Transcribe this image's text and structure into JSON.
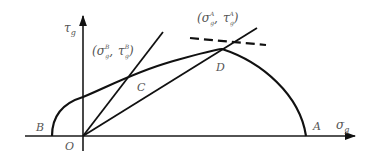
{
  "diagram": {
    "axes": {
      "x_label": "σ",
      "x_label_sub": "g",
      "y_label": "τ",
      "y_label_sub": "g",
      "origin_label": "O"
    },
    "points": {
      "A": "A",
      "B": "B",
      "C": "C",
      "D": "D"
    },
    "annotations": {
      "point_B_coords": {
        "open": "(",
        "sigma": "σ",
        "sigma_sub": "g",
        "sigma_sup": "B",
        "sep": ",",
        "tau": "τ",
        "tau_sub": "g",
        "tau_sup": "B",
        "close": ")"
      },
      "point_A_coords": {
        "open": "(",
        "sigma": "σ",
        "sigma_sub": "g",
        "sigma_sup": "A",
        "sep": ",",
        "tau": "τ",
        "tau_sub": "g",
        "tau_sup": "A",
        "close": ")"
      }
    },
    "elements": [
      "horizontal axis σg with arrow",
      "vertical axis τg with arrow",
      "arc from B through C and D to A",
      "ray from O through C",
      "ray from O through D",
      "dashed tangent line at D"
    ],
    "colors": {
      "line": "#111111",
      "label": "#555555",
      "background": "#ffffff"
    }
  }
}
